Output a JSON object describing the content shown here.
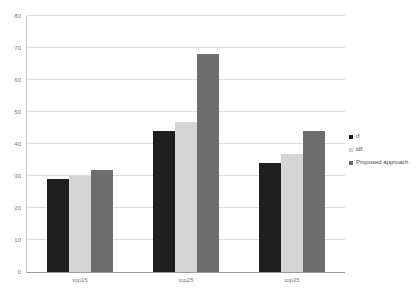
{
  "chart_data": {
    "type": "bar",
    "title": "",
    "categories": [
      "top15",
      "top25",
      "top35"
    ],
    "series": [
      {
        "name": "tf",
        "color": "#1e1e1e",
        "values": [
          29,
          44,
          34
        ]
      },
      {
        "name": "idf",
        "color": "#d5d5d5",
        "values": [
          30,
          47,
          37
        ]
      },
      {
        "name": "Proposed approach",
        "color": "#6d6d6d",
        "values": [
          32,
          68,
          44
        ]
      }
    ],
    "xlabel": "",
    "ylabel": "",
    "ylim": [
      0,
      80
    ],
    "yticks": [
      0,
      10,
      20,
      30,
      40,
      50,
      60,
      70,
      80
    ],
    "grid": true,
    "legend_position": "right",
    "background_color": "#ffffff",
    "gridline_color": "#dcdcdc",
    "axis_color": "#9c9c9c",
    "tick_text_color": "#7a7a7a"
  }
}
